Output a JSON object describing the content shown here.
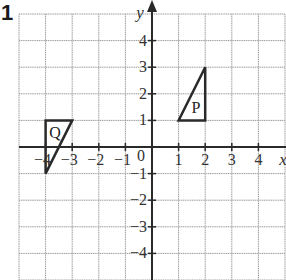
{
  "question_number": "1",
  "chart_data": {
    "type": "coordinate-grid",
    "title": "",
    "xlabel": "x",
    "ylabel": "y",
    "xlim": [
      -5,
      5
    ],
    "ylim": [
      -5,
      5
    ],
    "grid": true,
    "origin_label": "0",
    "x_ticks": [
      {
        "value": -4,
        "label": "−4"
      },
      {
        "value": -3,
        "label": "−3"
      },
      {
        "value": -2,
        "label": "−2"
      },
      {
        "value": -1,
        "label": "−1"
      },
      {
        "value": 1,
        "label": "1"
      },
      {
        "value": 2,
        "label": "2"
      },
      {
        "value": 3,
        "label": "3"
      },
      {
        "value": 4,
        "label": "4"
      }
    ],
    "y_ticks": [
      {
        "value": 4,
        "label": "4"
      },
      {
        "value": 3,
        "label": "3"
      },
      {
        "value": 2,
        "label": "2"
      },
      {
        "value": 1,
        "label": "1"
      },
      {
        "value": -1,
        "label": "−1"
      },
      {
        "value": -2,
        "label": "−2"
      },
      {
        "value": -3,
        "label": "−3"
      },
      {
        "value": -4,
        "label": "−4"
      }
    ],
    "shapes": [
      {
        "name": "P",
        "vertices": [
          [
            1,
            1
          ],
          [
            2,
            1
          ],
          [
            2,
            3
          ]
        ],
        "label_at": [
          1.65,
          1.5
        ]
      },
      {
        "name": "Q",
        "vertices": [
          [
            -4,
            1
          ],
          [
            -3,
            1
          ],
          [
            -4,
            -1
          ]
        ],
        "label_at": [
          -3.65,
          0.55
        ]
      }
    ]
  },
  "colors": {
    "grid": "#9a9a9a",
    "axis": "#2a2a2a",
    "shape": "#2a2a2a"
  }
}
